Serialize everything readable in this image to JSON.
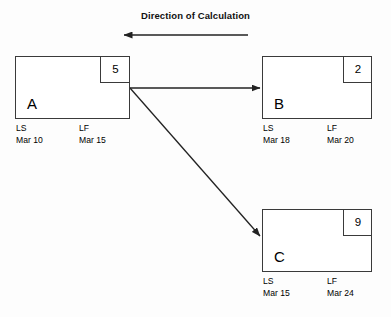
{
  "title": "Direction of Calculation",
  "nodes": [
    {
      "id": "a",
      "letter": "A",
      "duration": "5",
      "ls_code": "LS",
      "ls_date": "Mar 10",
      "lf_code": "LF",
      "lf_date": "Mar 15"
    },
    {
      "id": "b",
      "letter": "B",
      "duration": "2",
      "ls_code": "LS",
      "ls_date": "Mar 18",
      "lf_code": "LF",
      "lf_date": "Mar 20"
    },
    {
      "id": "c",
      "letter": "C",
      "duration": "9",
      "ls_code": "LS",
      "ls_date": "Mar 15",
      "lf_code": "LF",
      "lf_date": "Mar 24"
    }
  ],
  "colors": {
    "stroke": "#3a3a3a",
    "arrow": "#222222",
    "background": "#fdfdfd",
    "text": "#000000"
  },
  "arrows": [
    {
      "name": "direction-of-calculation-arrow",
      "from": "right",
      "to": "left"
    },
    {
      "name": "arrow-a-to-b",
      "from": "A",
      "to": "B"
    },
    {
      "name": "arrow-a-to-c",
      "from": "A",
      "to": "C"
    }
  ]
}
